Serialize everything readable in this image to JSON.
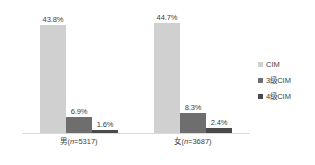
{
  "chart_data": {
    "type": "bar",
    "title": "",
    "subtitle": "",
    "xlabel": "",
    "ylabel": "",
    "grid": false,
    "legend_position": "right",
    "ylim": [
      0,
      50
    ],
    "categories": [
      "男(n=5317)",
      "女(n=3687)"
    ],
    "category_parts": [
      {
        "label": "男(",
        "n_italic": "n",
        "n_value": "=5317)"
      },
      {
        "label": "女(",
        "n_italic": "n",
        "n_value": "=3687)"
      }
    ],
    "series": [
      {
        "name": "CIM",
        "color": "#d0d0d0",
        "values": [
          43.8,
          44.7
        ],
        "labels": [
          "43.8%",
          "44.7%"
        ]
      },
      {
        "name": "3级CIM",
        "color": "#6e6e6e",
        "values": [
          6.9,
          8.3
        ],
        "labels": [
          "6.9%",
          "8.3%"
        ]
      },
      {
        "name": "4级CIM",
        "color": "#4a4a4a",
        "values": [
          1.6,
          2.4
        ],
        "labels": [
          "1.6%",
          "2.4%"
        ]
      }
    ]
  },
  "legend": {
    "items": [
      {
        "label": "CIM",
        "color": "#d0d0d0"
      },
      {
        "label": "3级CIM",
        "color": "#6e6e6e"
      },
      {
        "label": "4级CIM",
        "color": "#4a4a4a"
      }
    ]
  },
  "colors": {
    "background": "#ffffff",
    "baseline": "#d9d9d9",
    "text": "#3f3f3f",
    "series_1": "#d0d0d0",
    "series_2": "#6e6e6e",
    "series_3": "#4a4a4a"
  }
}
